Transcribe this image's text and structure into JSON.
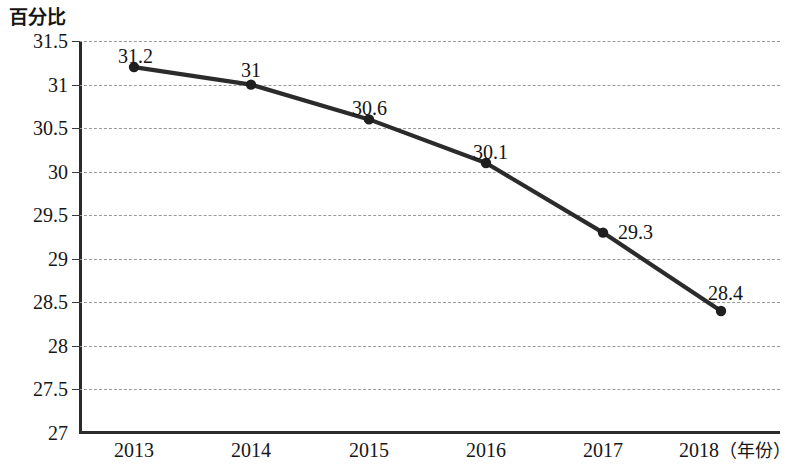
{
  "chart_data": {
    "type": "line",
    "title": "",
    "subtitle": "",
    "xlabel": "年份",
    "ylabel": "百分比",
    "x_axis_unit_label": "（年份）",
    "categories": [
      "2013",
      "2014",
      "2015",
      "2016",
      "2017",
      "2018"
    ],
    "values": [
      31.2,
      31,
      30.6,
      30.1,
      29.3,
      28.4
    ],
    "point_labels": [
      "31.2",
      "31",
      "30.6",
      "30.1",
      "29.3",
      "28.4"
    ],
    "series": [
      {
        "name": "百分比",
        "values": [
          31.2,
          31,
          30.6,
          30.1,
          29.3,
          28.4
        ]
      }
    ],
    "ylim": [
      27,
      31.5
    ],
    "ytick_labels": [
      "31.5",
      "31",
      "30.5",
      "30",
      "29.5",
      "29",
      "28.5",
      "28",
      "27.5",
      "27"
    ],
    "ytick_values": [
      31.5,
      31,
      30.5,
      30,
      29.5,
      29,
      28.5,
      28,
      27.5,
      27
    ],
    "grid": true,
    "grid_style": "dashed-horizontal",
    "legend": false,
    "legend_position": "none",
    "marker": "circle",
    "colors": {
      "line": "#2b2b2b",
      "marker": "#1f1f1f",
      "grid": "#9a9a9a",
      "axis": "#2b2b2b",
      "text": "#141414",
      "background": "#ffffff"
    }
  }
}
